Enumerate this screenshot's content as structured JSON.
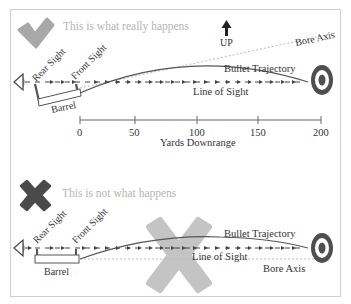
{
  "figure": {
    "colors": {
      "frame": "#cfcfcf",
      "check_mark": "#a8a8a8",
      "x_mark_dark": "#4a4a4a",
      "x_mark_light": "#c4c4c4",
      "line": "#555555",
      "bore_axis": "#bdbdbd",
      "target_ring": "#4f4f4f",
      "caption": "#b5b5b5"
    }
  },
  "correct_panel": {
    "icon": "check-mark-icon",
    "caption": "This is what really happens",
    "up_label": "UP",
    "labels": {
      "rear_sight": "Rear Sight",
      "front_sight": "Front Sight",
      "barrel": "Barrel",
      "bullet_trajectory": "Bullet Trajectory",
      "line_of_sight": "Line of Sight",
      "bore_axis": "Bore Axis"
    },
    "axis": {
      "title": "Yards Downrange",
      "ticks": [
        "0",
        "50",
        "100",
        "150",
        "200"
      ]
    }
  },
  "incorrect_panel": {
    "icon": "x-mark-icon",
    "caption": "This is not what happens",
    "labels": {
      "rear_sight": "Rear Sight",
      "front_sight": "Front Sight",
      "barrel": "Barrel",
      "bullet_trajectory": "Bullet Trajectory",
      "line_of_sight": "Line of Sight",
      "bore_axis": "Bore Axis"
    }
  }
}
